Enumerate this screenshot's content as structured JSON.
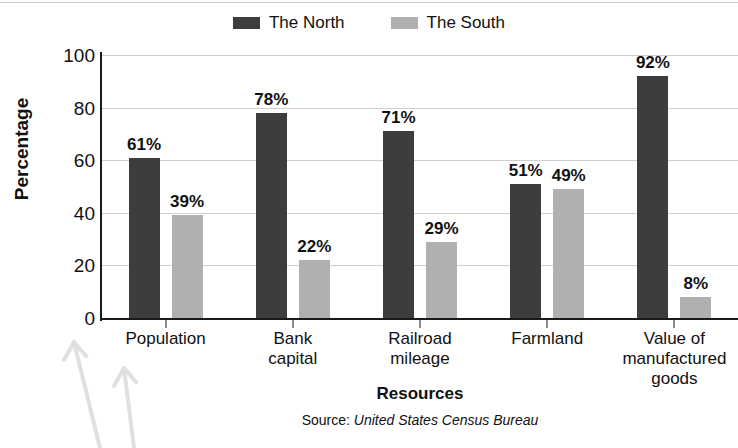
{
  "chart_data": {
    "type": "bar",
    "title": "",
    "xlabel": "Resources",
    "ylabel": "Percentage",
    "ylim": [
      0,
      100
    ],
    "yticks": [
      100,
      80,
      60,
      40,
      20,
      0
    ],
    "grid": true,
    "legend_position": "top-center",
    "value_suffix": "%",
    "categories": [
      "Population",
      "Bank\ncapital",
      "Railroad\nmileage",
      "Farmland",
      "Value of\nmanufactured\ngoods"
    ],
    "series": [
      {
        "name": "The North",
        "color": "#3d3d3d",
        "values": [
          61,
          78,
          71,
          51,
          92
        ],
        "labels": [
          "61%",
          "78%",
          "71%",
          "51%",
          "92%"
        ]
      },
      {
        "name": "The South",
        "color": "#b0b0b0",
        "values": [
          39,
          22,
          29,
          49,
          8
        ],
        "labels": [
          "39%",
          "22%",
          "29%",
          "49%",
          "8%"
        ]
      }
    ]
  },
  "legend": {
    "items": [
      {
        "label": "The North",
        "swatch": "legend-swatch-north"
      },
      {
        "label": "The South",
        "swatch": "legend-swatch-south"
      }
    ]
  },
  "source": {
    "prefix": "Source: ",
    "name": "United States Census Bureau"
  },
  "colors": {
    "north": "#3d3d3d",
    "south": "#b0b0b0",
    "gridline": "#cfcfcf",
    "axis": "#1a1a1a",
    "text": "#111111",
    "background": "#ffffff"
  }
}
